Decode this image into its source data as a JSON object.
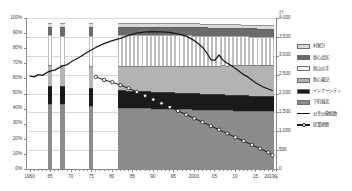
{
  "chart_data": {
    "type": "bar",
    "subtype": "stacked-bar-with-lines",
    "title": "",
    "xlabel": "",
    "ylabel": "",
    "y2label": "",
    "unit_right": "戸",
    "x_axis": {
      "tick_labels": [
        "1960",
        "65",
        "70",
        "75",
        "80",
        "85",
        "90",
        "95",
        "2000",
        "05",
        "10",
        "15",
        "2019年"
      ],
      "tick_years": [
        1960,
        1965,
        1970,
        1975,
        1980,
        1985,
        1990,
        1995,
        2000,
        2005,
        2010,
        2015,
        2019
      ],
      "range": [
        1959,
        2020
      ]
    },
    "y_left": {
      "tick_labels": [
        "0%",
        "10%",
        "20%",
        "30%",
        "40%",
        "50%",
        "60%",
        "70%",
        "80%",
        "90%",
        "100%"
      ],
      "ticks": [
        0,
        10,
        20,
        30,
        40,
        50,
        60,
        70,
        80,
        90,
        100
      ],
      "range": [
        0,
        100
      ],
      "grid": false
    },
    "y_right": {
      "tick_labels": [
        "0",
        "500",
        "1,000",
        "1,500",
        "2,000",
        "2,500",
        "3,000",
        "3,500",
        "4,000"
      ],
      "ticks": [
        0,
        500,
        1000,
        1500,
        2000,
        2500,
        3000,
        3500,
        4000
      ],
      "range": [
        0,
        4000
      ],
      "grid": true
    },
    "legend": {
      "position": "right",
      "entries": [
        {
          "label": "村家計",
          "type": "swatch",
          "color": "#d9d9d9"
        },
        {
          "label": "新心北区",
          "type": "swatch",
          "color": "#6b6b6b"
        },
        {
          "label": "新山の手",
          "type": "swatch",
          "color": "#ffffff"
        },
        {
          "label": "新心東記",
          "type": "swatch",
          "color": "#b3b3b3"
        },
        {
          "label": "インナーシティ",
          "type": "swatch",
          "color": "#1a1a1a"
        },
        {
          "label": "下町城北",
          "type": "swatch",
          "color": "#8c8c8c"
        },
        {
          "label": "公幸公働統数",
          "type": "line",
          "color": "#1a1a1a"
        },
        {
          "label": "民業総数",
          "type": "line-marker",
          "color": "#1a1a1a"
        }
      ]
    },
    "stack_order_bottom_to_top": [
      "下町城北",
      "インナーシティ",
      "新心東記",
      "新山の手",
      "新心北区",
      "村家計"
    ],
    "bars": [
      {
        "year": 1965,
        "total": 3880,
        "values": [
          1730,
          470,
          560,
          780,
          230,
          110
        ]
      },
      {
        "year": 1968,
        "total": 3880,
        "values": [
          1720,
          480,
          560,
          770,
          240,
          110
        ]
      },
      {
        "year": 1975,
        "total": 3880,
        "values": [
          1680,
          470,
          590,
          790,
          240,
          110
        ]
      },
      {
        "year": 1982,
        "total": 3880,
        "values": [
          1620,
          460,
          640,
          830,
          220,
          110
        ]
      },
      {
        "year": 1983,
        "total": 3880,
        "values": [
          1620,
          460,
          645,
          830,
          220,
          105
        ]
      },
      {
        "year": 1984,
        "total": 3880,
        "values": [
          1615,
          460,
          650,
          830,
          220,
          105
        ]
      },
      {
        "year": 1985,
        "total": 3880,
        "values": [
          1615,
          455,
          655,
          830,
          220,
          105
        ]
      },
      {
        "year": 1986,
        "total": 3880,
        "values": [
          1610,
          455,
          660,
          830,
          220,
          105
        ]
      },
      {
        "year": 1987,
        "total": 3880,
        "values": [
          1610,
          450,
          665,
          830,
          220,
          105
        ]
      },
      {
        "year": 1988,
        "total": 3880,
        "values": [
          1605,
          450,
          670,
          830,
          220,
          105
        ]
      },
      {
        "year": 1989,
        "total": 3880,
        "values": [
          1605,
          450,
          675,
          825,
          220,
          105
        ]
      },
      {
        "year": 1990,
        "total": 3880,
        "values": [
          1600,
          445,
          680,
          825,
          220,
          110
        ]
      },
      {
        "year": 1991,
        "total": 3880,
        "values": [
          1600,
          445,
          685,
          820,
          220,
          110
        ]
      },
      {
        "year": 1992,
        "total": 3870,
        "values": [
          1595,
          445,
          690,
          815,
          220,
          105
        ]
      },
      {
        "year": 1993,
        "total": 3870,
        "values": [
          1595,
          440,
          695,
          815,
          220,
          105
        ]
      },
      {
        "year": 1994,
        "total": 3870,
        "values": [
          1590,
          440,
          700,
          815,
          220,
          105
        ]
      },
      {
        "year": 1995,
        "total": 3870,
        "values": [
          1590,
          440,
          705,
          810,
          220,
          105
        ]
      },
      {
        "year": 1996,
        "total": 3865,
        "values": [
          1585,
          435,
          710,
          810,
          220,
          105
        ]
      },
      {
        "year": 1997,
        "total": 3865,
        "values": [
          1585,
          435,
          715,
          805,
          220,
          105
        ]
      },
      {
        "year": 1998,
        "total": 3860,
        "values": [
          1580,
          435,
          720,
          805,
          220,
          100
        ]
      },
      {
        "year": 1999,
        "total": 3860,
        "values": [
          1580,
          430,
          725,
          805,
          220,
          100
        ]
      },
      {
        "year": 2000,
        "total": 3855,
        "values": [
          1575,
          430,
          730,
          800,
          220,
          100
        ]
      },
      {
        "year": 2001,
        "total": 3855,
        "values": [
          1575,
          430,
          735,
          795,
          220,
          100
        ]
      },
      {
        "year": 2002,
        "total": 3850,
        "values": [
          1570,
          425,
          740,
          795,
          220,
          100
        ]
      },
      {
        "year": 2003,
        "total": 3850,
        "values": [
          1570,
          425,
          745,
          790,
          220,
          100
        ]
      },
      {
        "year": 2004,
        "total": 3845,
        "values": [
          1565,
          425,
          750,
          790,
          215,
          100
        ]
      },
      {
        "year": 2005,
        "total": 3845,
        "values": [
          1565,
          420,
          755,
          790,
          215,
          100
        ]
      },
      {
        "year": 2006,
        "total": 3840,
        "values": [
          1560,
          420,
          760,
          785,
          215,
          100
        ]
      },
      {
        "year": 2007,
        "total": 3840,
        "values": [
          1560,
          420,
          765,
          780,
          215,
          100
        ]
      },
      {
        "year": 2008,
        "total": 3835,
        "values": [
          1555,
          415,
          770,
          780,
          215,
          100
        ]
      },
      {
        "year": 2009,
        "total": 3835,
        "values": [
          1555,
          415,
          775,
          775,
          215,
          100
        ]
      },
      {
        "year": 2010,
        "total": 3830,
        "values": [
          1550,
          415,
          780,
          775,
          215,
          95
        ]
      },
      {
        "year": 2011,
        "total": 3830,
        "values": [
          1550,
          410,
          785,
          775,
          215,
          95
        ]
      },
      {
        "year": 2012,
        "total": 3825,
        "values": [
          1545,
          410,
          790,
          770,
          215,
          95
        ]
      },
      {
        "year": 2013,
        "total": 3825,
        "values": [
          1545,
          410,
          795,
          765,
          215,
          95
        ]
      },
      {
        "year": 2014,
        "total": 3820,
        "values": [
          1540,
          405,
          800,
          765,
          215,
          95
        ]
      },
      {
        "year": 2015,
        "total": 3820,
        "values": [
          1540,
          405,
          805,
          760,
          215,
          95
        ]
      },
      {
        "year": 2016,
        "total": 3815,
        "values": [
          1535,
          405,
          810,
          760,
          210,
          95
        ]
      },
      {
        "year": 2017,
        "total": 3815,
        "values": [
          1535,
          400,
          815,
          755,
          210,
          95
        ]
      },
      {
        "year": 2018,
        "total": 3810,
        "values": [
          1530,
          400,
          820,
          755,
          210,
          95
        ]
      },
      {
        "year": 2019,
        "total": 3810,
        "values": [
          1530,
          400,
          825,
          750,
          210,
          95
        ]
      }
    ],
    "series": [
      {
        "name": "公幸公働統数",
        "style": "solid-line",
        "axis": "left-percent",
        "points": [
          {
            "year": 1960,
            "value": 61.5
          },
          {
            "year": 1961,
            "value": 61.0
          },
          {
            "year": 1962,
            "value": 62.5
          },
          {
            "year": 1963,
            "value": 62.0
          },
          {
            "year": 1964,
            "value": 63.8
          },
          {
            "year": 1965,
            "value": 65.0
          },
          {
            "year": 1966,
            "value": 65.5
          },
          {
            "year": 1967,
            "value": 67.0
          },
          {
            "year": 1968,
            "value": 68.5
          },
          {
            "year": 1969,
            "value": 69.0
          },
          {
            "year": 1970,
            "value": 71.0
          },
          {
            "year": 1972,
            "value": 74.0
          },
          {
            "year": 1974,
            "value": 77.5
          },
          {
            "year": 1976,
            "value": 80.5
          },
          {
            "year": 1978,
            "value": 83.0
          },
          {
            "year": 1980,
            "value": 85.0
          },
          {
            "year": 1982,
            "value": 86.5
          },
          {
            "year": 1984,
            "value": 88.5
          },
          {
            "year": 1986,
            "value": 90.0
          },
          {
            "year": 1988,
            "value": 90.8
          },
          {
            "year": 1990,
            "value": 91.0
          },
          {
            "year": 1992,
            "value": 90.8
          },
          {
            "year": 1994,
            "value": 90.5
          },
          {
            "year": 1996,
            "value": 89.5
          },
          {
            "year": 1998,
            "value": 88.0
          },
          {
            "year": 2000,
            "value": 85.0
          },
          {
            "year": 2001,
            "value": 83.0
          },
          {
            "year": 2002,
            "value": 80.5
          },
          {
            "year": 2003,
            "value": 77.0
          },
          {
            "year": 2004,
            "value": 72.5
          },
          {
            "year": 2005,
            "value": 72.0
          },
          {
            "year": 2006,
            "value": 75.5
          },
          {
            "year": 2007,
            "value": 72.0
          },
          {
            "year": 2008,
            "value": 70.0
          },
          {
            "year": 2009,
            "value": 68.5
          },
          {
            "year": 2010,
            "value": 66.5
          },
          {
            "year": 2011,
            "value": 64.5
          },
          {
            "year": 2012,
            "value": 62.5
          },
          {
            "year": 2013,
            "value": 61.0
          },
          {
            "year": 2014,
            "value": 59.0
          },
          {
            "year": 2015,
            "value": 57.0
          },
          {
            "year": 2016,
            "value": 55.5
          },
          {
            "year": 2017,
            "value": 54.0
          },
          {
            "year": 2018,
            "value": 53.0
          },
          {
            "year": 2019,
            "value": 52.0
          }
        ]
      },
      {
        "name": "民業総数",
        "style": "dotted-line-with-markers",
        "axis": "left-percent",
        "points": [
          {
            "year": 1976,
            "value": 61.0
          },
          {
            "year": 1978,
            "value": 59.0
          },
          {
            "year": 1980,
            "value": 57.5
          },
          {
            "year": 1982,
            "value": 55.5
          },
          {
            "year": 1984,
            "value": 53.5
          },
          {
            "year": 1986,
            "value": 51.0
          },
          {
            "year": 1988,
            "value": 48.5
          },
          {
            "year": 1990,
            "value": 46.0
          },
          {
            "year": 1992,
            "value": 43.5
          },
          {
            "year": 1994,
            "value": 41.0
          },
          {
            "year": 1996,
            "value": 38.5
          },
          {
            "year": 1998,
            "value": 36.0
          },
          {
            "year": 2000,
            "value": 33.5
          },
          {
            "year": 2002,
            "value": 31.0
          },
          {
            "year": 2004,
            "value": 28.5
          },
          {
            "year": 2006,
            "value": 26.0
          },
          {
            "year": 2008,
            "value": 23.5
          },
          {
            "year": 2010,
            "value": 21.0
          },
          {
            "year": 2012,
            "value": 18.5
          },
          {
            "year": 2014,
            "value": 16.0
          },
          {
            "year": 2016,
            "value": 13.5
          },
          {
            "year": 2018,
            "value": 11.0
          },
          {
            "year": 2019,
            "value": 9.0
          }
        ]
      }
    ]
  }
}
